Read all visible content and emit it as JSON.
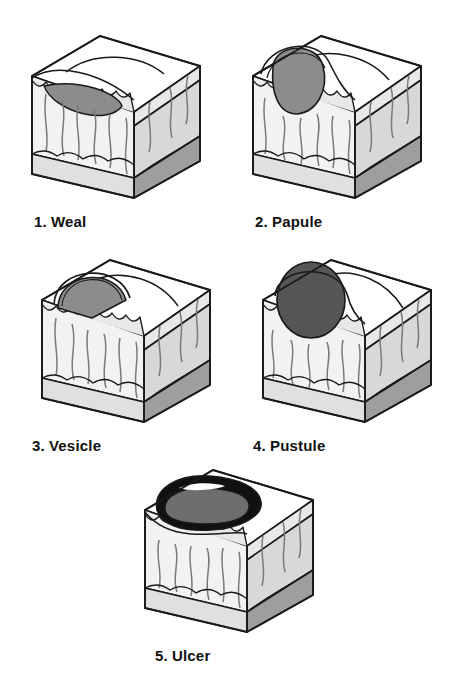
{
  "figure": {
    "background_color": "#ffffff",
    "panel_count": 5
  },
  "palette": {
    "outline": "#1a1a1a",
    "top_surface": "#ffffff",
    "epidermis_band": "#e8e8e8",
    "dermis_front": "#f2f2f2",
    "dermis_side": "#d8d8d8",
    "subcutis_front": "#e0e0e0",
    "subcutis_side": "#9e9e9e",
    "lesion_gray": "#8c8c8c",
    "lesion_dark": "#565656",
    "ulcer_black": "#111111",
    "label_text": "#111111"
  },
  "panels": [
    {
      "index": "1.",
      "name": "Weal",
      "label_full": "1. Weal",
      "lesion_type": "weal",
      "lesion_description": "flat raised gray swelling within the dermis beneath a smooth bulging epidermis",
      "lesion_fill": "#8c8c8c"
    },
    {
      "index": "2.",
      "name": "Papule",
      "label_full": "2. Papule",
      "lesion_type": "papule",
      "lesion_description": "solid gray dome raised above the skin surface and extending into the dermis",
      "lesion_fill": "#8c8c8c"
    },
    {
      "index": "3.",
      "name": "Vesicle",
      "label_full": "3. Vesicle",
      "lesion_type": "vesicle",
      "lesion_description": "fluid filled blister sitting on top of the epidermis",
      "lesion_fill": "#8c8c8c"
    },
    {
      "index": "4.",
      "name": "Pustule",
      "label_full": "4. Pustule",
      "lesion_type": "pustule",
      "lesion_description": "dark pus filled round swelling raised above the skin surface",
      "lesion_fill": "#565656"
    },
    {
      "index": "5.",
      "name": "Ulcer",
      "label_full": "5. Ulcer",
      "lesion_type": "ulcer",
      "lesion_description": "open crater with dark rim eroding through the epidermis into the dermis",
      "lesion_fill": "#565656"
    }
  ],
  "skin_layers": [
    {
      "name": "epidermis",
      "order": 1
    },
    {
      "name": "dermis",
      "order": 2
    },
    {
      "name": "subcutaneous-fat",
      "order": 3
    }
  ]
}
